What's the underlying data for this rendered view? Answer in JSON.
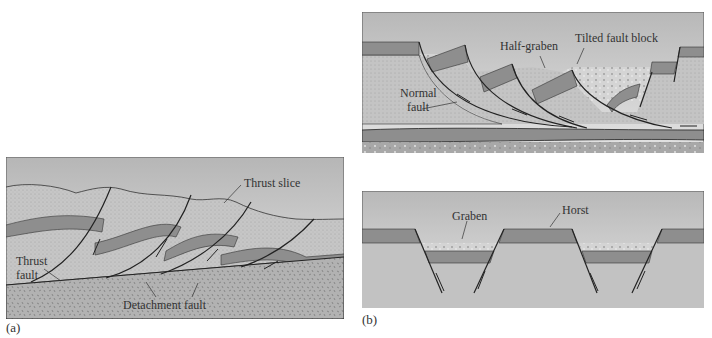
{
  "figure": {
    "panel_a": {
      "tag": "(a)",
      "labels": {
        "thrust_slice": "Thrust slice",
        "thrust_fault_line1": "Thrust",
        "thrust_fault_line2": "fault",
        "detachment_fault": "Detachment fault"
      }
    },
    "panel_b_top": {
      "labels": {
        "half_graben": "Half-graben",
        "tilted_fault_block": "Tilted fault block",
        "normal_fault_line1": "Normal",
        "normal_fault_line2": "fault"
      }
    },
    "panel_b_bottom": {
      "tag": "(b)",
      "labels": {
        "graben": "Graben",
        "horst": "Horst"
      }
    },
    "colors": {
      "sky_top": "#b8b8b8",
      "sky_bottom": "#e4e4e4",
      "rock_light": "#c4c4c4",
      "rock_band": "#8e8e8e",
      "basement": "#b0b0b0",
      "sediment": "#d2d2d2",
      "line": "#222222"
    }
  }
}
